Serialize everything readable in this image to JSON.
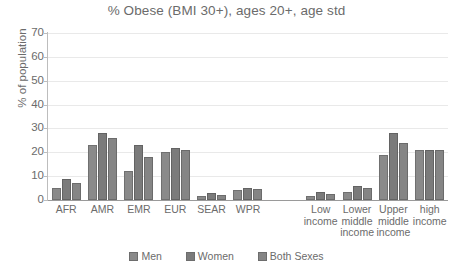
{
  "chart_data": {
    "type": "bar",
    "title": "% Obese (BMI 30+), ages 20+, age std",
    "xlabel": "",
    "ylabel": "% of population",
    "ylim": [
      0,
      70
    ],
    "ytick_step": 10,
    "yticks": [
      "70",
      "60",
      "50",
      "40",
      "30",
      "20",
      "10",
      "0"
    ],
    "grid": true,
    "legend_position": "bottom",
    "categories": [
      "AFR",
      "AMR",
      "EMR",
      "EUR",
      "SEAR",
      "WPR",
      "",
      "Low income",
      "Lower middle income",
      "Upper middle income",
      "high income"
    ],
    "category_label_lines": [
      [
        "AFR"
      ],
      [
        "AMR"
      ],
      [
        "EMR"
      ],
      [
        "EUR"
      ],
      [
        "SEAR"
      ],
      [
        "WPR"
      ],
      [
        ""
      ],
      [
        "Low",
        "income"
      ],
      [
        "Lower",
        "middle",
        "income"
      ],
      [
        "Upper",
        "middle",
        "income"
      ],
      [
        "high",
        "income"
      ]
    ],
    "series": [
      {
        "name": "Men",
        "color": "#8a8a8a",
        "values": [
          5,
          23,
          12,
          20,
          1.5,
          4,
          null,
          1.5,
          3.5,
          19,
          21
        ]
      },
      {
        "name": "Women",
        "color": "#7b7b7b",
        "values": [
          9,
          28,
          23,
          22,
          3,
          5,
          null,
          3.5,
          6,
          28,
          21
        ]
      },
      {
        "name": "Both Sexes",
        "color": "#858585",
        "values": [
          7,
          26,
          18,
          21,
          2,
          4.5,
          null,
          2.5,
          5,
          24,
          21
        ]
      }
    ]
  },
  "legend": {
    "items": [
      {
        "label": "Men"
      },
      {
        "label": "Women"
      },
      {
        "label": "Both Sexes"
      }
    ]
  }
}
